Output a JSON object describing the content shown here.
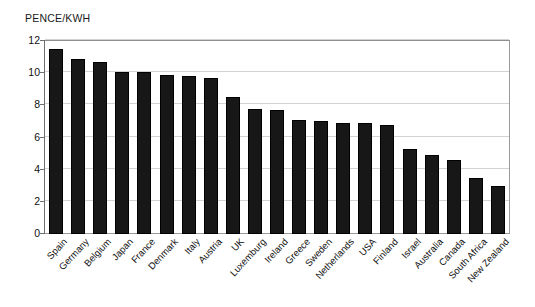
{
  "chart_data": {
    "type": "bar",
    "title": "",
    "xlabel": "",
    "ylabel": "PENCE/KWH",
    "ylim": [
      0,
      12
    ],
    "ytick_values": [
      0,
      2,
      4,
      6,
      8,
      10,
      12
    ],
    "ytick_labels": [
      "0",
      "2",
      "4",
      "6",
      "8",
      "10",
      "12"
    ],
    "grid": true,
    "legend": "none",
    "bar_color": "#171717",
    "categories": [
      "Spain",
      "Germany",
      "Belgium",
      "Japan",
      "France",
      "Denmark",
      "Italy",
      "Austria",
      "UK",
      "Luxemburg",
      "Ireland",
      "Greece",
      "Sweden",
      "Netherlands",
      "USA",
      "Finland",
      "Israel",
      "Australia",
      "Canada",
      "South Africa",
      "New Zealand"
    ],
    "values": [
      11.5,
      10.9,
      10.7,
      10.1,
      10.1,
      9.9,
      9.8,
      9.7,
      8.5,
      7.8,
      7.7,
      7.1,
      7.0,
      6.9,
      6.9,
      6.8,
      5.3,
      4.9,
      4.6,
      3.5,
      3.0
    ]
  },
  "axis": {
    "y_title": "PENCE/KWH"
  }
}
